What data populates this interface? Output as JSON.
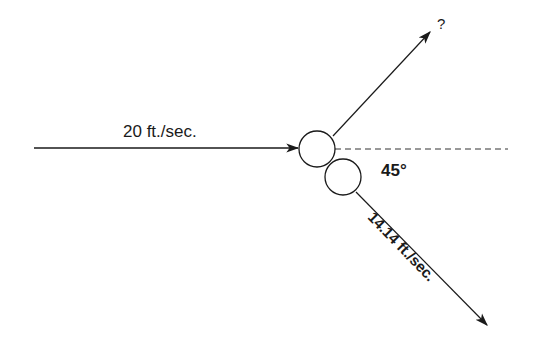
{
  "diagram": {
    "type": "collision-vector-diagram",
    "incoming": {
      "label": "20 ft./sec.",
      "start": [
        34,
        148
      ],
      "end": [
        298,
        148
      ]
    },
    "outgoing_upper": {
      "label": "?",
      "start": [
        333,
        136
      ],
      "end": [
        430,
        32
      ]
    },
    "outgoing_lower": {
      "label": "14.14 ft./sec.",
      "start": [
        356,
        192
      ],
      "end": [
        487,
        325
      ]
    },
    "reference_line": {
      "style": "dashed",
      "start": [
        335,
        149
      ],
      "end": [
        508,
        149
      ]
    },
    "angle_label": "45°",
    "balls": [
      {
        "cx": 317,
        "cy": 149,
        "r": 18
      },
      {
        "cx": 343,
        "cy": 177,
        "r": 18
      }
    ],
    "colors": {
      "stroke": "#1a1a1a",
      "dashed": "#333333",
      "background": "#ffffff"
    }
  }
}
